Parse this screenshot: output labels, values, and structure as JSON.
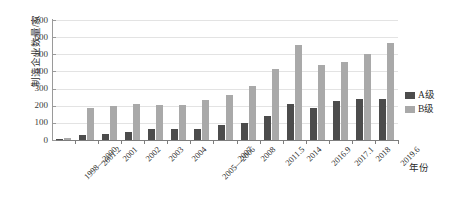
{
  "top_strip_text": "",
  "chart_data": {
    "type": "bar",
    "title": "",
    "xlabel": "年份",
    "ylabel": "制造企业数量/家",
    "ylim": [
      0,
      700
    ],
    "ytick_step": 100,
    "yticks": [
      700,
      600,
      500,
      400,
      300,
      200,
      100,
      0
    ],
    "grid": true,
    "legend_position": "right",
    "categories": [
      "1998—2000",
      "2001.2",
      "2001",
      "2002",
      "2003",
      "2004",
      "2005—2006",
      "2007",
      "2008",
      "2011.5",
      "2014",
      "2016.9",
      "2017.1",
      "2018",
      "2019.6"
    ],
    "series": [
      {
        "name": "A级",
        "color": "#4c4c4c",
        "values": [
          8,
          28,
          38,
          45,
          62,
          65,
          65,
          88,
          98,
          143,
          208,
          185,
          225,
          238,
          238
        ]
      },
      {
        "name": "B级",
        "color": "#a9a9a9",
        "values": [
          13,
          187,
          197,
          208,
          205,
          205,
          235,
          260,
          318,
          417,
          555,
          440,
          453,
          503,
          567
        ]
      }
    ]
  },
  "legend": {
    "items": [
      {
        "label": "A级",
        "color": "#4c4c4c"
      },
      {
        "label": "B级",
        "color": "#a9a9a9"
      }
    ]
  },
  "colors": {
    "series_a": "#4c4c4c",
    "series_b": "#a9a9a9",
    "gridline": "#e3e3e3",
    "axis": "#7d7d7d",
    "text": "#2b2b2b",
    "background": "#ffffff"
  }
}
